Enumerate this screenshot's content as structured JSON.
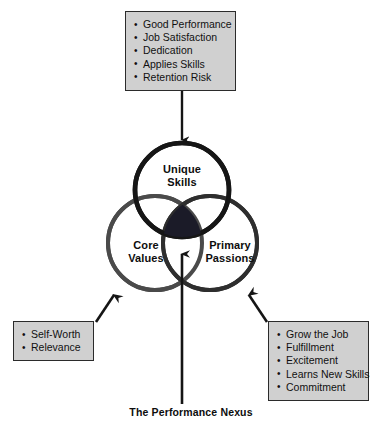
{
  "diagram": {
    "caption": "The Performance Nexus",
    "circles": [
      {
        "id": "unique-skills",
        "label_line1": "Unique",
        "label_line2": "Skills",
        "stroke": "#161616"
      },
      {
        "id": "core-values",
        "label_line1": "Core",
        "label_line2": "Values",
        "stroke": "#4a4a4a"
      },
      {
        "id": "primary-passions",
        "label_line1": "Primary",
        "label_line2": "Passions",
        "stroke": "#2e2e2e"
      }
    ],
    "intersection": {
      "name": "nexus-core",
      "fill": "#1b1b28"
    },
    "boxes": {
      "top": {
        "title": "outcomes-of-unique-skills",
        "items": [
          "Good Performance",
          "Job Satisfaction",
          "Dedication",
          "Applies Skills",
          "Retention Risk"
        ]
      },
      "bottom_left": {
        "title": "core-values-drivers",
        "items": [
          "Self-Worth",
          "Relevance"
        ]
      },
      "bottom_right": {
        "title": "primary-passions-drivers",
        "items": [
          "Grow the Job",
          "Fulfillment",
          "Excitement",
          "Learns New Skills",
          "Commitment"
        ]
      }
    },
    "colors": {
      "box_fill": "#d0d0d0",
      "box_border": "#2b2b2b",
      "arrow": "#151515",
      "text": "#101010",
      "background": "#ffffff"
    }
  }
}
